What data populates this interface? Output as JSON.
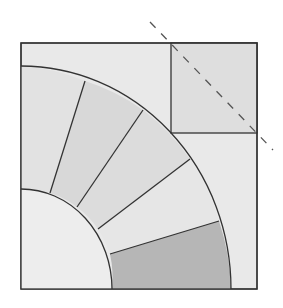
{
  "diagram": {
    "type": "quilt-block",
    "outer_square": {
      "x": 21,
      "y": 43,
      "size_w": 236,
      "size_h": 246,
      "fill": "#e9e9e9"
    },
    "corner_square": {
      "x": 171,
      "y": 43,
      "w": 86,
      "h": 90,
      "fill": "#dedede"
    },
    "fan_segments": [
      {
        "name": "segment-1",
        "fill": "#e2e2e2"
      },
      {
        "name": "segment-2",
        "fill": "#d8d8d8"
      },
      {
        "name": "segment-3",
        "fill": "#dcdcdc"
      },
      {
        "name": "segment-4",
        "fill": "#e6e6e6"
      },
      {
        "name": "segment-5",
        "fill": "#b6b6b6"
      }
    ],
    "inner_quarter_circle": {
      "fill": "#ededed"
    },
    "stroke_color": "#333333",
    "dashed_line": {
      "x1": 150,
      "y1": 22,
      "x2": 273,
      "y2": 150,
      "color": "#555555"
    }
  }
}
